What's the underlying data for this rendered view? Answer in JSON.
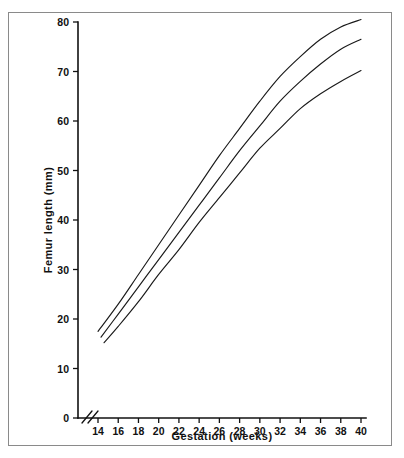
{
  "figure": {
    "background_color": "#ffffff",
    "frame_color": "#8a8a8a",
    "line_color": "#1a1a1a",
    "caption_fragment": ""
  },
  "chart_data": {
    "type": "line",
    "title": "",
    "xlabel": "Gestation (weeks)",
    "ylabel": "Femur length (mm)",
    "xlim": [
      13,
      40
    ],
    "ylim": [
      0,
      80
    ],
    "xticks": [
      14,
      16,
      18,
      20,
      22,
      24,
      26,
      28,
      30,
      32,
      34,
      36,
      38,
      40
    ],
    "yticks": [
      0,
      10,
      20,
      30,
      40,
      50,
      60,
      70,
      80
    ],
    "xtick_labels": [
      "14",
      "16",
      "18",
      "20",
      "22",
      "24",
      "26",
      "28",
      "30",
      "32",
      "34",
      "36",
      "38",
      "40"
    ],
    "ytick_labels": [
      "0",
      "10",
      "20",
      "30",
      "40",
      "50",
      "60",
      "70",
      "80"
    ],
    "grid": false,
    "legend": false,
    "axis_break": {
      "axis": "x",
      "symbol": "double-slash",
      "between": [
        0,
        14
      ]
    },
    "x": [
      14,
      16,
      18,
      20,
      22,
      24,
      26,
      28,
      30,
      32,
      34,
      36,
      38,
      40
    ],
    "series": [
      {
        "name": "95th centile",
        "start_week": 14,
        "values": [
          17.5,
          23.0,
          29.0,
          35.0,
          41.0,
          47.0,
          53.0,
          58.5,
          64.0,
          69.0,
          73.0,
          76.5,
          79.0,
          80.5
        ]
      },
      {
        "name": "50th centile",
        "start_week": 14.3,
        "values": [
          15.5,
          21.0,
          26.5,
          32.0,
          37.5,
          43.0,
          48.5,
          54.0,
          59.0,
          64.0,
          68.0,
          71.5,
          74.5,
          76.5
        ]
      },
      {
        "name": "5th centile",
        "start_week": 14.6,
        "values": [
          13.8,
          18.5,
          23.5,
          29.0,
          34.0,
          39.5,
          44.5,
          49.5,
          54.5,
          58.5,
          62.5,
          65.5,
          68.0,
          70.2
        ]
      }
    ]
  }
}
